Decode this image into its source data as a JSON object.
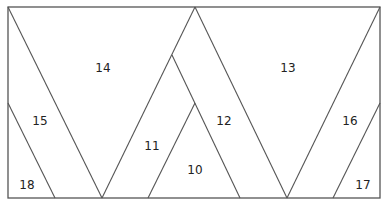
{
  "diagram": {
    "stroke_color": "#555555",
    "regions": [
      {
        "id": "r14",
        "label": "14",
        "x": 103,
        "y": 68
      },
      {
        "id": "r13",
        "label": "13",
        "x": 288,
        "y": 68
      },
      {
        "id": "r15",
        "label": "15",
        "x": 40,
        "y": 121
      },
      {
        "id": "r16",
        "label": "16",
        "x": 350,
        "y": 121
      },
      {
        "id": "r12",
        "label": "12",
        "x": 224,
        "y": 121
      },
      {
        "id": "r11",
        "label": "11",
        "x": 152,
        "y": 146
      },
      {
        "id": "r10",
        "label": "10",
        "x": 195,
        "y": 170
      },
      {
        "id": "r18",
        "label": "18",
        "x": 27,
        "y": 185
      },
      {
        "id": "r17",
        "label": "17",
        "x": 363,
        "y": 185
      }
    ]
  }
}
